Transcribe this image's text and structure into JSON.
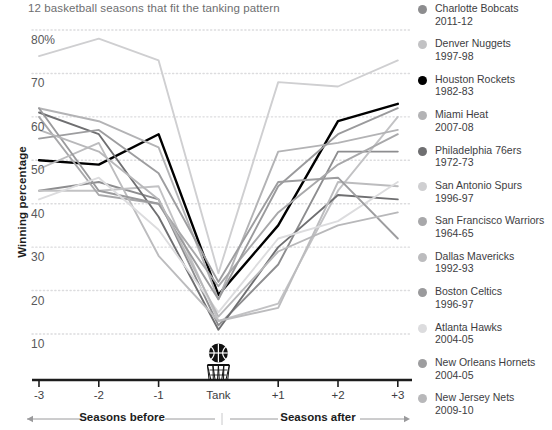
{
  "chart_data": {
    "type": "line",
    "title": "12 basketball seasons that fit the tanking pattern",
    "xlabel": "",
    "ylabel": "Winning percentage",
    "categories": [
      "-3",
      "-2",
      "-1",
      "Tank",
      "+1",
      "+2",
      "+3"
    ],
    "ylim": [
      5,
      82
    ],
    "yticks": [
      10,
      20,
      30,
      40,
      50,
      60,
      70,
      80
    ],
    "ytick_labels": [
      "10",
      "20",
      "30",
      "40",
      "50",
      "60",
      "70",
      "80%"
    ],
    "grid": true,
    "legend_position": "right",
    "axis_annotations": {
      "left": "Seasons before",
      "right": "Seasons after",
      "center_marker": "basketball-hoop-icon"
    },
    "series": [
      {
        "name": "Charlotte Bobcats",
        "season": "2011-12",
        "color": "#8d8d8f",
        "values": [
          43,
          45,
          41,
          12,
          26,
          52,
          52
        ]
      },
      {
        "name": "Denver Nuggets",
        "season": "1997-98",
        "color": "#c2c2c4",
        "values": [
          43,
          43,
          44,
          13,
          17,
          43,
          60
        ]
      },
      {
        "name": "Houston Rockets",
        "season": "1982-83",
        "color": "#000000",
        "values": [
          50,
          49,
          56,
          19,
          35,
          59,
          63
        ]
      },
      {
        "name": "Miami Heat",
        "season": "2007-08",
        "color": "#b3b3b5",
        "values": [
          62,
          59,
          53,
          18,
          52,
          54,
          57
        ]
      },
      {
        "name": "Philadelphia 76ers",
        "season": "1972-73",
        "color": "#6f6f71",
        "values": [
          61,
          56,
          37,
          11,
          30,
          42,
          41
        ]
      },
      {
        "name": "San Antonio Spurs",
        "season": "1996-97",
        "color": "#cfcfd1",
        "values": [
          74,
          78,
          73,
          24,
          68,
          67,
          73
        ]
      },
      {
        "name": "San Francisco Warriors",
        "season": "1964-65",
        "color": "#a8a8aa",
        "values": [
          60,
          42,
          40,
          21,
          38,
          49,
          56
        ]
      },
      {
        "name": "Dallas Mavericks",
        "season": "1992-93",
        "color": "#bcbcbe",
        "values": [
          48,
          54,
          28,
          13,
          16,
          45,
          44
        ]
      },
      {
        "name": "Boston Celtics",
        "season": "1996-97",
        "color": "#9a9a9c",
        "values": [
          62,
          43,
          40,
          18,
          44,
          56,
          62
        ]
      },
      {
        "name": "Atlanta Hawks",
        "season": "2004-05",
        "color": "#dcdcde",
        "values": [
          41,
          46,
          34,
          15,
          32,
          36,
          45
        ]
      },
      {
        "name": "New Orleans Hornets",
        "season": "2004-05",
        "color": "#9d9d9f",
        "values": [
          55,
          57,
          47,
          22,
          45,
          46,
          32
        ]
      },
      {
        "name": "New Jersey Nets",
        "season": "2009-10",
        "color": "#b8b8ba",
        "values": [
          57,
          52,
          41,
          14,
          29,
          35,
          38
        ]
      }
    ]
  },
  "legend": {
    "items": [
      {
        "team": "Charlotte Bobcats",
        "season": "2011-12",
        "color": "#8d8d8f"
      },
      {
        "team": "Denver Nuggets",
        "season": "1997-98",
        "color": "#c2c2c4"
      },
      {
        "team": "Houston Rockets",
        "season": "1982-83",
        "color": "#000000"
      },
      {
        "team": "Miami Heat",
        "season": "2007-08",
        "color": "#b3b3b5"
      },
      {
        "team": "Philadelphia 76ers",
        "season": "1972-73",
        "color": "#6f6f71"
      },
      {
        "team": "San Antonio Spurs",
        "season": "1996-97",
        "color": "#cfcfd1"
      },
      {
        "team": "San Francisco Warriors",
        "season": "1964-65",
        "color": "#a8a8aa"
      },
      {
        "team": "Dallas Mavericks",
        "season": "1992-93",
        "color": "#bcbcbe"
      },
      {
        "team": "Boston Celtics",
        "season": "1996-97",
        "color": "#9a9a9c"
      },
      {
        "team": "Atlanta Hawks",
        "season": "2004-05",
        "color": "#dcdcde"
      },
      {
        "team": "New Orleans Hornets",
        "season": "2004-05",
        "color": "#9d9d9f"
      },
      {
        "team": "New Jersey Nets",
        "season": "2009-10",
        "color": "#b8b8ba"
      }
    ]
  },
  "colors": {
    "grid": "#dcdcde",
    "axis": "#1c1c1c",
    "text": "#58585a",
    "highlight": "#000000"
  }
}
